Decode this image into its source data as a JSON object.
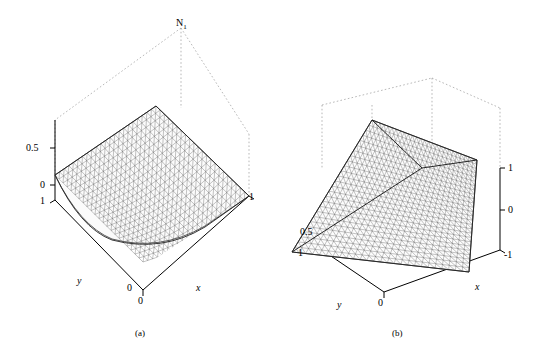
{
  "figure": {
    "background": "#ffffff",
    "line_color": "#000000",
    "mesh_color": "#444444",
    "dotted_color": "#888888"
  },
  "panels": [
    {
      "key": "a",
      "caption": "(a)",
      "peak_label": "N",
      "peak_label_sub": "1",
      "axes": {
        "x_label": "x",
        "y_label": "y",
        "z_ticks": [
          "0.5",
          "0"
        ],
        "x_ticks": [
          "0",
          "1"
        ],
        "y_ticks": [
          "1",
          "0"
        ]
      }
    },
    {
      "key": "b",
      "caption": "(b)",
      "axes": {
        "x_label": "x",
        "y_label": "y",
        "z_ticks": [
          "1",
          "0",
          "0.5"
        ],
        "x_ticks": [
          "0",
          "-1"
        ],
        "y_ticks": [
          "1",
          "0"
        ]
      }
    }
  ],
  "chart_data": {
    "type": "surface",
    "title": "",
    "subtitle": "",
    "panel_count": 2,
    "charts": [
      {
        "id": "a",
        "caption": "(a)",
        "type": "surface",
        "surface_label": "N1",
        "description": "Triangular-mesh 3D surface plot of shape function N1 over a triangular/quadrilateral domain, peaking at value 1 at one corner and falling to 0 along the opposite edge",
        "xlabel": "x",
        "ylabel": "y",
        "zlabel": "N1",
        "xlim": [
          0,
          1
        ],
        "ylim": [
          0,
          1
        ],
        "zlim": [
          0,
          1
        ],
        "z_ticks": [
          0,
          0.5
        ],
        "x_ticks": [
          0,
          1
        ],
        "y_ticks": [
          0,
          1
        ],
        "grid": false,
        "legend": "none",
        "mesh": "triangular"
      },
      {
        "id": "b",
        "caption": "(b)",
        "type": "surface",
        "description": "Triangular-mesh 3D surface plot, saddle-like bilinear surface over square domain with a ridge/fold across the centre",
        "xlabel": "x",
        "ylabel": "y",
        "zlabel": "",
        "xlim": [
          -1,
          0
        ],
        "ylim": [
          0,
          1
        ],
        "zlim": [
          0,
          1
        ],
        "z_ticks": [
          0,
          0.5,
          1
        ],
        "x_ticks": [
          -1,
          0
        ],
        "y_ticks": [
          0,
          1
        ],
        "grid": false,
        "legend": "none",
        "mesh": "triangular"
      }
    ]
  }
}
